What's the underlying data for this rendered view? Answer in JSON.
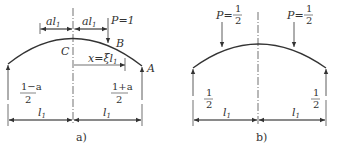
{
  "figure": {
    "panel_a": {
      "caption": "a)",
      "dim_top_left": "al",
      "dim_top_left_sub": "1",
      "dim_top_right": "al",
      "dim_top_right_sub": "1",
      "load_label": "P=1",
      "point_B": "B",
      "point_C": "C",
      "point_A": "A",
      "x_dim": "x=ξl",
      "x_dim_sub": "1",
      "reaction_left_num": "1−a",
      "reaction_left_den": "2",
      "reaction_right_num": "1+a",
      "reaction_right_den": "2",
      "span_left": "l",
      "span_left_sub": "1",
      "span_right": "l",
      "span_right_sub": "1"
    },
    "panel_b": {
      "caption": "b)",
      "load_left_prefix": "P=",
      "load_left_num": "1",
      "load_left_den": "2",
      "load_right_prefix": "P=",
      "load_right_num": "1",
      "load_right_den": "2",
      "reaction_left_num": "1",
      "reaction_left_den": "2",
      "reaction_right_num": "1",
      "reaction_right_den": "2",
      "span_left": "l",
      "span_left_sub": "1",
      "span_right": "l",
      "span_right_sub": "1"
    },
    "colors": {
      "line": "#333333",
      "background": "#ffffff"
    }
  }
}
